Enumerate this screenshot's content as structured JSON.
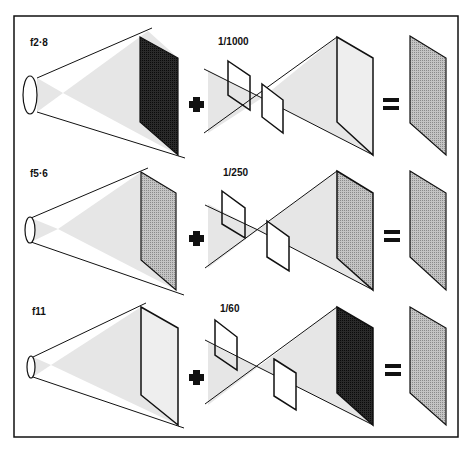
{
  "colors": {
    "line": "#111111",
    "cone_fill": "#e6e6e6",
    "screen_dark": "#1a1a1a",
    "screen_mid": "#a8a8a8",
    "screen_light": "#e8e8e8",
    "result": "#b0b0b0"
  },
  "rows": [
    {
      "aperture_label": "f2·8",
      "shutter_label": "1/1000",
      "aperture_exposure": "dark",
      "shutter_exposure": "light",
      "plus": "+",
      "equals": "="
    },
    {
      "aperture_label": "f5·6",
      "shutter_label": "1/250",
      "aperture_exposure": "mid",
      "shutter_exposure": "mid",
      "plus": "+",
      "equals": "="
    },
    {
      "aperture_label": "f11",
      "shutter_label": "1/60",
      "aperture_exposure": "light",
      "shutter_exposure": "dark",
      "plus": "+",
      "equals": "="
    }
  ]
}
